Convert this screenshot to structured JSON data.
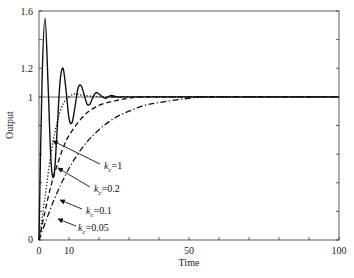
{
  "chart_data": {
    "type": "line",
    "title": "",
    "xlabel": "Time",
    "ylabel": "Output",
    "xlim": [
      0,
      100
    ],
    "ylim": [
      0,
      1.6
    ],
    "x_ticks": [
      0,
      10,
      50,
      100
    ],
    "x_tick_labels": [
      "0",
      "10",
      "50",
      "100"
    ],
    "x_minor_ticks": [
      20,
      30,
      40,
      60,
      70,
      80,
      90
    ],
    "y_ticks": [
      0,
      1,
      1.2,
      1.6
    ],
    "y_tick_labels": [
      "0",
      "1",
      "1.2",
      "1.6"
    ],
    "y_minor_ticks": [
      0.2,
      0.4,
      0.6,
      0.8,
      1.4
    ],
    "grid": false,
    "reference_line": {
      "y": 1,
      "style": "solid"
    },
    "legend": "inline annotations with arrows",
    "series": [
      {
        "name": "kc=1",
        "label_sub": "c",
        "label_val": "=1",
        "style": "solid",
        "description": "underdamped oscillation, overshoot to ~1.55 at t~2, decaying oscillations settling by t~25",
        "x": [
          0,
          1,
          2,
          3,
          4,
          5,
          6,
          7,
          8,
          9,
          10,
          11,
          12,
          13,
          14,
          15,
          16,
          17,
          18,
          19,
          20,
          22,
          24,
          26,
          28,
          30,
          100
        ],
        "y": [
          0,
          1.1,
          1.55,
          1.1,
          0.55,
          0.45,
          0.75,
          1.1,
          1.2,
          1.05,
          0.85,
          0.82,
          0.93,
          1.06,
          1.08,
          1.02,
          0.95,
          0.95,
          1.0,
          1.03,
          1.02,
          0.99,
          1.01,
          1.0,
          1.0,
          1.0,
          1.0
        ]
      },
      {
        "name": "kc=0.2",
        "label_sub": "c",
        "label_val": "=0.2",
        "style": "dotted",
        "description": "fast rise with slight overshoot around t~12",
        "x": [
          0,
          2,
          4,
          6,
          8,
          10,
          12,
          15,
          20,
          25,
          30,
          100
        ],
        "y": [
          0,
          0.3,
          0.6,
          0.82,
          0.95,
          1.0,
          1.02,
          1.01,
          1.0,
          1.0,
          1.0,
          1.0
        ]
      },
      {
        "name": "kc=0.1",
        "label_sub": "c",
        "label_val": "=0.1",
        "style": "dashed",
        "description": "first-order-like approach",
        "x": [
          0,
          2,
          4,
          6,
          8,
          10,
          15,
          20,
          25,
          30,
          40,
          100
        ],
        "y": [
          0,
          0.2,
          0.38,
          0.52,
          0.64,
          0.73,
          0.87,
          0.94,
          0.97,
          0.99,
          1.0,
          1.0
        ]
      },
      {
        "name": "kc=0.05",
        "label_sub": "c",
        "label_val": "=0.05",
        "style": "dash-dot",
        "description": "slowest approach to 1",
        "x": [
          0,
          5,
          10,
          15,
          20,
          25,
          30,
          35,
          40,
          50,
          60,
          100
        ],
        "y": [
          0,
          0.28,
          0.5,
          0.66,
          0.77,
          0.85,
          0.9,
          0.94,
          0.96,
          0.99,
          1.0,
          1.0
        ]
      }
    ]
  },
  "axes": {
    "x_title": "Time",
    "y_title": "Output",
    "x_ticks": [
      "0",
      "10",
      "50",
      "100"
    ],
    "y_ticks": [
      "0",
      "1",
      "1.2",
      "1.6"
    ]
  },
  "annotations": [
    {
      "k": "k",
      "sub": "c",
      "val": "=1"
    },
    {
      "k": "k",
      "sub": "c",
      "val": "=0.2"
    },
    {
      "k": "k",
      "sub": "c",
      "val": "=0.1"
    },
    {
      "k": "k",
      "sub": "c",
      "val": "=0.05"
    }
  ]
}
